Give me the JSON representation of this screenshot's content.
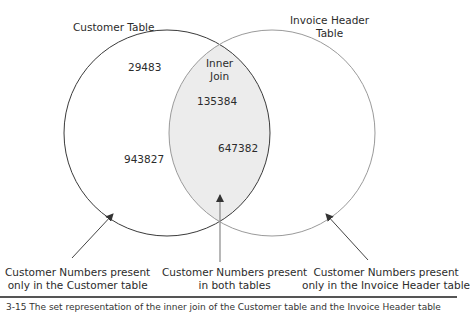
{
  "diagram": {
    "type": "venn",
    "sets": [
      {
        "id": "left",
        "label": "Customer Table",
        "only_values": [
          "29483",
          "943827"
        ],
        "stroke": "#3a3a3a"
      },
      {
        "id": "right",
        "label_line1": "Invoice Header",
        "label_line2": "Table",
        "only_values": [],
        "stroke": "#9a9a9a"
      }
    ],
    "intersection": {
      "label_line1": "Inner",
      "label_line2": "Join",
      "values": [
        "135384",
        "647382"
      ],
      "fill": "#ececec"
    },
    "callouts": {
      "left": {
        "line1": "Customer Numbers present",
        "line2": "only in the Customer table"
      },
      "middle": {
        "line1": "Customer Numbers present",
        "line2": "in both tables"
      },
      "right": {
        "line1": "Customer Numbers present",
        "line2": "only in the Invoice Header table"
      }
    },
    "caption": "3-15    The set representation of the inner join of the Customer table and the Invoice Header table"
  }
}
